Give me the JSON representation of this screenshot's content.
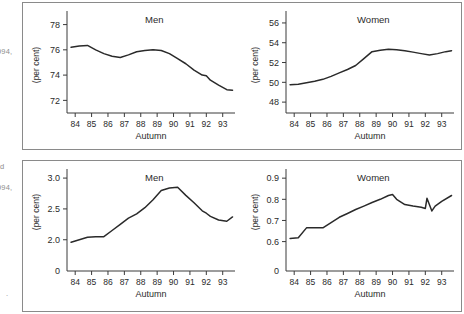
{
  "marginalia": {
    "note_top": "994,",
    "note_mid_letter": "d",
    "note_mid": "994,",
    "note_bottom": "."
  },
  "panels": [
    {
      "id": "panel-top",
      "charts": [
        "chart_top_men",
        "chart_top_women"
      ]
    },
    {
      "id": "panel-bottom",
      "charts": [
        "chart_bottom_men",
        "chart_bottom_women"
      ]
    }
  ],
  "axis_title_x": "Autumn",
  "axis_title_y": "(per cent)",
  "chart_data": [
    {
      "id": "chart_top_men",
      "type": "line",
      "title": "Men",
      "xlabel": "Autumn",
      "ylabel": "(per cent)",
      "xtick_labels": [
        "84",
        "85",
        "86",
        "87",
        "88",
        "89",
        "90",
        "91",
        "92",
        "93"
      ],
      "ytick_labels": [
        "78",
        "76",
        "74",
        "72"
      ],
      "ylim": [
        71.0,
        78.6
      ],
      "ytick_values": [
        78,
        76,
        74,
        72
      ],
      "xlim": [
        83.5,
        93.75
      ],
      "grid": false,
      "legend": false,
      "x": [
        83.75,
        84.25,
        84.75,
        85.25,
        85.75,
        86.25,
        86.75,
        87.25,
        87.75,
        88.25,
        88.75,
        89.25,
        89.75,
        90.25,
        90.75,
        91.25,
        91.75,
        92.0,
        92.25,
        92.75,
        93.25,
        93.6
      ],
      "y": [
        76.2,
        76.3,
        76.35,
        76.0,
        75.7,
        75.5,
        75.4,
        75.6,
        75.85,
        75.95,
        76.0,
        75.95,
        75.7,
        75.3,
        74.9,
        74.4,
        74.0,
        73.95,
        73.6,
        73.2,
        72.85,
        72.8
      ]
    },
    {
      "id": "chart_top_women",
      "type": "line",
      "title": "Women",
      "xlabel": "Autumn",
      "ylabel": "(per cent)",
      "xtick_labels": [
        "84",
        "85",
        "86",
        "87",
        "88",
        "89",
        "90",
        "91",
        "92",
        "93"
      ],
      "ytick_labels": [
        "56",
        "54",
        "52",
        "50",
        "48"
      ],
      "ylim": [
        46.9,
        56.6
      ],
      "ytick_values": [
        56,
        54,
        52,
        50,
        48
      ],
      "xlim": [
        83.5,
        93.75
      ],
      "grid": false,
      "legend": false,
      "x": [
        83.75,
        84.25,
        84.75,
        85.25,
        85.75,
        86.25,
        86.75,
        87.25,
        87.75,
        88.25,
        88.75,
        89.25,
        89.75,
        90.25,
        90.75,
        91.25,
        91.75,
        92.25,
        92.75,
        93.25,
        93.6
      ],
      "y": [
        49.75,
        49.8,
        49.95,
        50.1,
        50.3,
        50.6,
        50.95,
        51.3,
        51.7,
        52.4,
        53.1,
        53.25,
        53.35,
        53.3,
        53.2,
        53.05,
        52.9,
        52.75,
        52.9,
        53.1,
        53.2
      ]
    },
    {
      "id": "chart_bottom_men",
      "type": "line",
      "title": "Men",
      "xlabel": "Autumn",
      "ylabel": "(per cent)",
      "xtick_labels": [
        "84",
        "85",
        "86",
        "87",
        "88",
        "89",
        "90",
        "91",
        "92",
        "93"
      ],
      "ytick_labels": [
        "3.0",
        "2.5",
        "2.0",
        "0"
      ],
      "ylim_main": [
        1.85,
        3.05
      ],
      "ytick_values": [
        3.0,
        2.5,
        2.0
      ],
      "axis_broken_zero_label": "0",
      "xlim": [
        83.5,
        93.75
      ],
      "grid": false,
      "legend": false,
      "x": [
        83.75,
        84.25,
        84.75,
        85.25,
        85.75,
        86.25,
        86.75,
        87.25,
        87.75,
        88.25,
        88.75,
        89.25,
        89.75,
        90.25,
        90.75,
        91.25,
        91.75,
        92.0,
        92.25,
        92.75,
        93.25,
        93.6
      ],
      "y": [
        1.96,
        2.0,
        2.04,
        2.05,
        2.05,
        2.15,
        2.25,
        2.35,
        2.42,
        2.52,
        2.65,
        2.8,
        2.84,
        2.85,
        2.72,
        2.6,
        2.47,
        2.43,
        2.38,
        2.32,
        2.3,
        2.37
      ]
    },
    {
      "id": "chart_bottom_women",
      "type": "line",
      "title": "Women",
      "xlabel": "Autumn",
      "ylabel": "(per cent)",
      "xtick_labels": [
        "84",
        "85",
        "86",
        "87",
        "88",
        "89",
        "90",
        "91",
        "92",
        "93"
      ],
      "ytick_labels": [
        "0.9",
        "0.8",
        "0.7",
        "0.6",
        "0"
      ],
      "ylim_main": [
        0.565,
        0.915
      ],
      "ytick_values": [
        0.9,
        0.8,
        0.7,
        0.6
      ],
      "axis_broken_zero_label": "0",
      "xlim": [
        83.5,
        93.75
      ],
      "grid": false,
      "legend": false,
      "x": [
        83.75,
        84.25,
        84.75,
        85.25,
        85.75,
        86.25,
        86.75,
        87.25,
        87.75,
        88.25,
        88.75,
        89.25,
        89.75,
        90.0,
        90.25,
        90.75,
        91.25,
        91.75,
        92.0,
        92.1,
        92.4,
        92.6,
        93.0,
        93.6
      ],
      "y": [
        0.615,
        0.618,
        0.665,
        0.665,
        0.665,
        0.69,
        0.715,
        0.733,
        0.752,
        0.768,
        0.785,
        0.8,
        0.818,
        0.823,
        0.8,
        0.775,
        0.768,
        0.762,
        0.757,
        0.805,
        0.745,
        0.768,
        0.79,
        0.818
      ]
    }
  ]
}
